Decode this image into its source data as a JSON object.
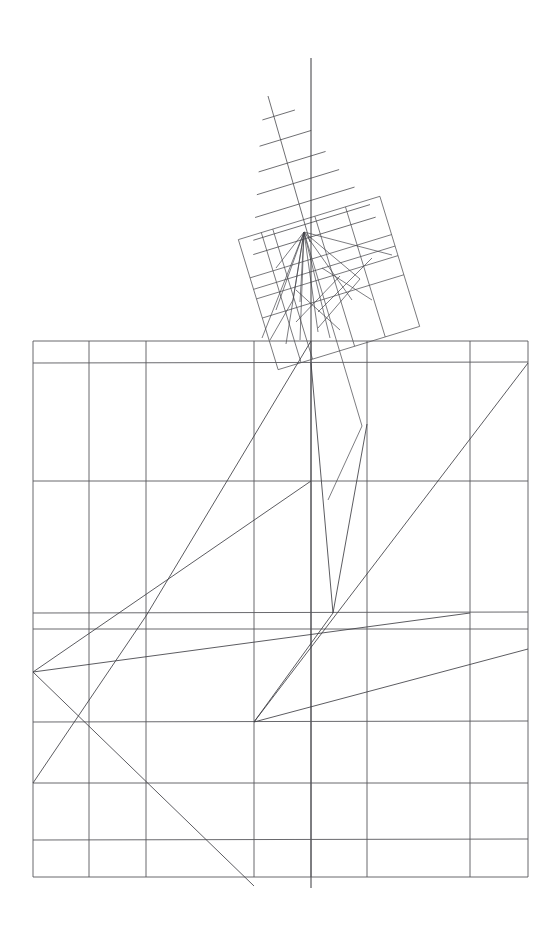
{
  "document": {
    "title": "Geometric line drawing",
    "description": "Technical line figure: large axis-aligned rectangular grid with internal polylines, and a smaller rotated copy of the same grid above whose grid lines extend upward as rays, crossed by a long vertical axis line.",
    "background_color": "#ffffff",
    "width": 556,
    "height": 927
  },
  "style": {
    "grid_stroke": "#58585c",
    "small_grid_stroke": "#4e4e52",
    "ray_stroke": "#4a4a4e",
    "polyline_stroke": "#3f3f44",
    "axis_stroke": "#3a3a3f",
    "stroke_width_grid": 0.9,
    "stroke_width_small": 0.75,
    "stroke_width_poly": 0.85
  },
  "chart_data": {
    "type": "line",
    "xlabel": "",
    "ylabel": "",
    "xlim": [
      0,
      556
    ],
    "ylim": [
      0,
      927
    ],
    "grid": true,
    "legend": "none",
    "annotations": [
      "large axis-aligned grid with 8 vertical and 9 horizontal lines",
      "rotated duplicate grid, approx -17 degrees, above the main grid",
      "rotated grid horizontal lines extended upward-left as long rays",
      "vertical axis line from y=58 to y=888 at x=311",
      "interior polylines spanning the main grid"
    ],
    "main_grid": {
      "name": "main-grid",
      "x_left": 33,
      "x_right": 528,
      "y_top": 341,
      "y_bottom": 877,
      "vertical_lines_x": [
        33,
        89,
        146,
        254,
        311,
        367,
        470,
        528
      ],
      "horizontal_lines_y": [
        341,
        363,
        481,
        613,
        629,
        722,
        783,
        840,
        877
      ]
    },
    "rotated_grid": {
      "name": "rotated-grid",
      "rotation_degrees": -17,
      "center_x": 329,
      "center_y": 283,
      "width": 148,
      "height": 136,
      "local_vertical_lines_x": [
        0,
        24,
        36,
        80,
        112,
        148
      ],
      "local_horizontal_lines_y": [
        0,
        40,
        52,
        62,
        82,
        136
      ]
    },
    "vertical_axis": {
      "name": "vertical-axis",
      "x": 311,
      "y_start": 58,
      "y_end": 888
    },
    "rays": {
      "name": "extension-rays",
      "origin_x": 304,
      "origin_y": 232,
      "count": 7,
      "description": "grid lines of the rotated square extended beyond its upper-left boundary"
    },
    "main_polylines": [
      {
        "name": "polyline-a",
        "points": [
          [
            311,
            341
          ],
          [
            146,
            616
          ],
          [
            33,
            783
          ]
        ]
      },
      {
        "name": "polyline-b",
        "points": [
          [
            311,
            481
          ],
          [
            33,
            672
          ],
          [
            254,
            886
          ]
        ]
      },
      {
        "name": "polyline-c",
        "points": [
          [
            367,
            424
          ],
          [
            333,
            613
          ],
          [
            254,
            722
          ],
          [
            528,
            649
          ]
        ]
      },
      {
        "name": "polyline-d",
        "points": [
          [
            33,
            672
          ],
          [
            470,
            613
          ]
        ]
      },
      {
        "name": "polyline-e",
        "points": [
          [
            254,
            722
          ],
          [
            528,
            363
          ]
        ]
      },
      {
        "name": "polyline-f",
        "points": [
          [
            311,
            363
          ],
          [
            333,
            613
          ]
        ]
      }
    ],
    "small_polylines": [
      {
        "name": "small-polyline-a",
        "points": [
          [
            304,
            232
          ],
          [
            276,
            310
          ]
        ]
      },
      {
        "name": "small-polyline-b",
        "points": [
          [
            304,
            232
          ],
          [
            360,
            279
          ],
          [
            318,
            328
          ]
        ]
      },
      {
        "name": "small-polyline-c",
        "points": [
          [
            304,
            232
          ],
          [
            392,
            255
          ]
        ]
      },
      {
        "name": "small-polyline-d",
        "points": [
          [
            304,
            232
          ],
          [
            330,
            338
          ]
        ]
      }
    ]
  }
}
